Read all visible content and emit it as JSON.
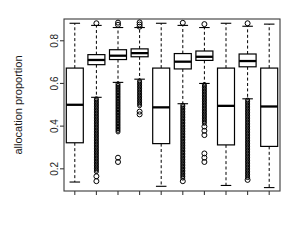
{
  "chart_data": {
    "type": "box",
    "title": "",
    "xlabel": "",
    "ylabel": "allocation proportion",
    "ylim": [
      0.1,
      0.9
    ],
    "yticks": [
      0.2,
      0.4,
      0.6,
      0.8
    ],
    "ytick_labels": [
      "0.2",
      "0.4",
      "0.6",
      "0.8"
    ],
    "xticks": [
      1,
      2,
      3,
      4,
      5,
      6,
      7,
      8,
      9,
      10
    ],
    "xtick_labels": [
      "",
      "",
      "",
      "",
      "",
      "",
      "",
      "",
      "",
      ""
    ],
    "grid": false,
    "legend": "none",
    "box_fill": "#ffffff",
    "box_stroke": "#000000",
    "median_stroke": "#000000",
    "whisker_style": "dashed",
    "outlier_marker": "circle",
    "frame": true,
    "boxes": [
      {
        "index": 1,
        "q1": 0.322,
        "median": 0.5,
        "q3": 0.672,
        "whisker_low": 0.138,
        "whisker_high": 0.882,
        "outliers": [],
        "outlier_column": null
      },
      {
        "index": 2,
        "q1": 0.688,
        "median": 0.71,
        "q3": 0.735,
        "whisker_low": 0.535,
        "whisker_high": 0.872,
        "outliers": [
          0.882,
          0.165,
          0.142
        ],
        "outlier_column": {
          "top": 0.528,
          "bottom": 0.182
        }
      },
      {
        "index": 3,
        "q1": 0.712,
        "median": 0.73,
        "q3": 0.758,
        "whisker_low": 0.605,
        "whisker_high": 0.862,
        "outliers": [
          0.885,
          0.875,
          0.252,
          0.232
        ],
        "outlier_column": {
          "top": 0.598,
          "bottom": 0.372
        }
      },
      {
        "index": 4,
        "q1": 0.725,
        "median": 0.742,
        "q3": 0.762,
        "whisker_low": 0.62,
        "whisker_high": 0.862,
        "outliers": [
          0.886,
          0.876,
          0.866,
          0.468,
          0.455
        ],
        "outlier_column": {
          "top": 0.612,
          "bottom": 0.492
        }
      },
      {
        "index": 5,
        "q1": 0.318,
        "median": 0.488,
        "q3": 0.672,
        "whisker_low": 0.118,
        "whisker_high": 0.882,
        "outliers": [],
        "outlier_column": null
      },
      {
        "index": 6,
        "q1": 0.668,
        "median": 0.702,
        "q3": 0.74,
        "whisker_low": 0.505,
        "whisker_high": 0.872,
        "outliers": [
          0.884,
          0.142
        ],
        "outlier_column": {
          "top": 0.498,
          "bottom": 0.152
        }
      },
      {
        "index": 7,
        "q1": 0.708,
        "median": 0.725,
        "q3": 0.752,
        "whisker_low": 0.6,
        "whisker_high": 0.862,
        "outliers": [
          0.878,
          0.398,
          0.378,
          0.358,
          0.272,
          0.252,
          0.232
        ],
        "outlier_column": {
          "top": 0.595,
          "bottom": 0.412
        }
      },
      {
        "index": 8,
        "q1": 0.312,
        "median": 0.495,
        "q3": 0.672,
        "whisker_low": 0.122,
        "whisker_high": 0.882,
        "outliers": [],
        "outlier_column": null
      },
      {
        "index": 9,
        "q1": 0.678,
        "median": 0.705,
        "q3": 0.738,
        "whisker_low": 0.528,
        "whisker_high": 0.868,
        "outliers": [
          0.882,
          0.148
        ],
        "outlier_column": {
          "top": 0.522,
          "bottom": 0.158
        }
      },
      {
        "index": 10,
        "q1": 0.305,
        "median": 0.492,
        "q3": 0.672,
        "whisker_low": 0.112,
        "whisker_high": 0.878,
        "outliers": [],
        "outlier_column": null
      }
    ]
  },
  "layout": {
    "frame_left": 64,
    "frame_right": 280,
    "frame_top": 19,
    "frame_bottom": 191,
    "y_value_top": 0.902,
    "y_value_bottom": 0.096,
    "box_half_width": 8.5,
    "narrow_half_width": 8.5,
    "tick_len": 4
  }
}
